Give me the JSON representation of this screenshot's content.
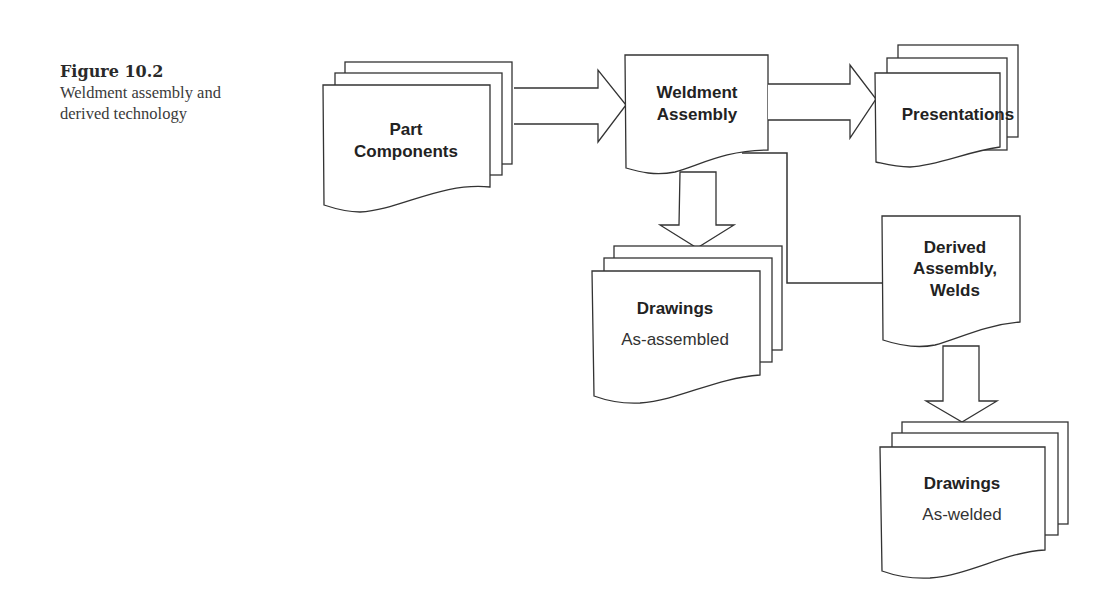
{
  "caption": {
    "figure_number": "Figure 10.2",
    "description_line1": "Weldment assembly and",
    "description_line2": "derived technology"
  },
  "nodes": {
    "part_components": {
      "line1": "Part",
      "line2": "Components",
      "stacked": true
    },
    "weldment_assembly": {
      "line1": "Weldment",
      "line2": "Assembly",
      "stacked": false
    },
    "presentations": {
      "line1": "Presentations",
      "stacked": true
    },
    "drawings_assembled": {
      "line1": "Drawings",
      "line2": "As-assembled",
      "stacked": true
    },
    "derived_assembly": {
      "line1": "Derived",
      "line2": "Assembly,",
      "line3": "Welds",
      "stacked": false
    },
    "drawings_welded": {
      "line1": "Drawings",
      "line2": "As-welded",
      "stacked": true
    }
  },
  "edges": [
    {
      "from": "Part Components",
      "to": "Weldment Assembly",
      "style": "block-arrow"
    },
    {
      "from": "Weldment Assembly",
      "to": "Presentations",
      "style": "block-arrow"
    },
    {
      "from": "Weldment Assembly",
      "to": "Drawings As-assembled",
      "style": "block-arrow"
    },
    {
      "from": "Weldment Assembly",
      "to": "Derived Assembly, Welds",
      "style": "line"
    },
    {
      "from": "Derived Assembly, Welds",
      "to": "Drawings As-welded",
      "style": "block-arrow"
    }
  ]
}
